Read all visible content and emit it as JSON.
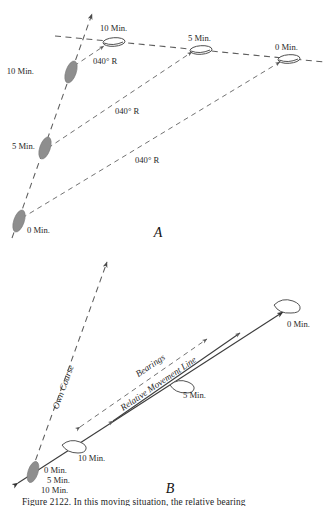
{
  "figure": {
    "panel_a_label": "A",
    "panel_b_label": "B",
    "caption": "Figure 2122.  In this moving situation, the relative bearing"
  },
  "panel_a": {
    "own_ship_labels": [
      "10 Min.",
      "5 Min.",
      "0 Min."
    ],
    "target_ship_labels": [
      "10 Min.",
      "5 Min.",
      "0 Min."
    ],
    "bearing_labels": [
      "040° R",
      "040° R",
      "040° R"
    ],
    "bearing_value": "040° R"
  },
  "panel_b": {
    "own_course_label": "Own Course",
    "bearings_label": "Bearings",
    "relative_movement_label": "Relative Movement Line",
    "target_0": "0 Min.",
    "target_5": "5 Min.",
    "target_10": "10 Min.",
    "own_stack": [
      "0 Min.",
      "5 Min.",
      "10 Min."
    ]
  },
  "colors": {
    "ship_filled": "#8e8e8e",
    "line": "#5d5d5d",
    "solid_line": "#3c3c3c",
    "background": "#ffffff"
  }
}
